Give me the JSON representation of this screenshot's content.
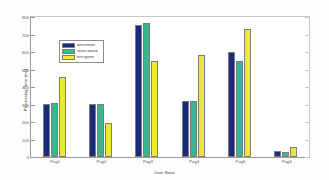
{
  "chart_data": {
    "type": "bar",
    "title": "",
    "xlabel": "User Base",
    "ylabel": "Processing Time (ms)",
    "categories": [
      "Pag1",
      "Pag2",
      "Pag3",
      "Pag4",
      "Pag5",
      "Pag6"
    ],
    "series": [
      {
        "name": "Benchmark",
        "color": "#1c2a7a",
        "values": [
          305,
          305,
          755,
          320,
          600,
          35
        ]
      },
      {
        "name": "Naive-Based",
        "color": "#3cb58f",
        "values": [
          310,
          305,
          765,
          320,
          550,
          30
        ]
      },
      {
        "name": "Encryption",
        "color": "#ece83a",
        "values": [
          455,
          195,
          550,
          585,
          730,
          55
        ]
      }
    ],
    "ylim": [
      0,
      800
    ],
    "yticks": [
      0,
      100,
      200,
      300,
      400,
      500,
      600,
      700,
      800
    ],
    "ytick_labels": [
      "0",
      "100",
      "200",
      "300",
      "400",
      "500",
      "600",
      "700",
      "800"
    ],
    "grid": false,
    "legend_position": "upper-left-inside"
  },
  "legend": {
    "entries": [
      {
        "label": "Benchmark"
      },
      {
        "label": "Naive-Based"
      },
      {
        "label": "Encryption"
      }
    ]
  }
}
